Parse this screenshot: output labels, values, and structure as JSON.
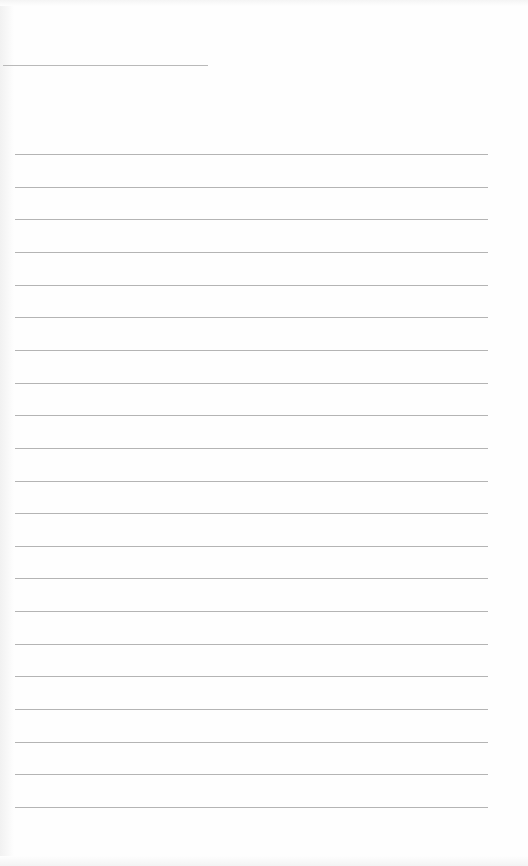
{
  "document": {
    "type": "lined-paper",
    "header_line": {
      "x": 3,
      "y": 65,
      "width": 205
    },
    "ruled_lines": {
      "count": 21,
      "first_y": 154,
      "spacing": 32.65,
      "x_start": 15,
      "x_end": 488,
      "color": "#b4b4b4"
    },
    "text_content": []
  }
}
